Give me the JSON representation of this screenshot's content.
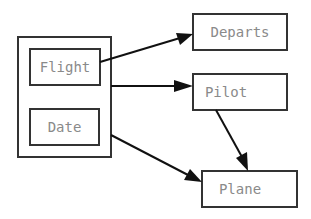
{
  "diagram": {
    "group": {
      "name": "composite-key",
      "members": [
        "Flight",
        "Date"
      ]
    },
    "nodes": [
      {
        "id": "flight",
        "label": "Flight"
      },
      {
        "id": "date",
        "label": "Date"
      },
      {
        "id": "departs",
        "label": "Departs"
      },
      {
        "id": "pilot",
        "label": "Pilot"
      },
      {
        "id": "plane",
        "label": "Plane"
      }
    ],
    "edges": [
      {
        "from": "flight",
        "to": "departs"
      },
      {
        "from": "group",
        "to": "pilot"
      },
      {
        "from": "group",
        "to": "plane"
      },
      {
        "from": "pilot",
        "to": "plane"
      }
    ]
  }
}
